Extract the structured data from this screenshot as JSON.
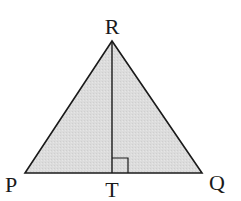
{
  "diagram": {
    "type": "triangle-with-altitude",
    "fill_color": "#dcdcdc",
    "stroke_color": "#1a1a1a",
    "vertices": {
      "R": {
        "label": "R",
        "x": 112,
        "y": 41
      },
      "P": {
        "label": "P",
        "x": 25,
        "y": 173
      },
      "Q": {
        "label": "Q",
        "x": 202,
        "y": 173
      },
      "T": {
        "label": "T",
        "x": 112,
        "y": 173
      }
    },
    "labels": {
      "R": "R",
      "P": "P",
      "Q": "Q",
      "T": "T"
    },
    "segments": [
      "PR",
      "RQ",
      "PQ",
      "RT"
    ],
    "right_angle_marker": {
      "at": "T",
      "size": 16
    }
  }
}
